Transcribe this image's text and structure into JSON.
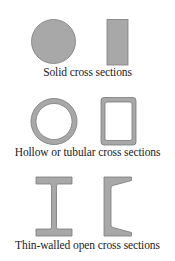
{
  "colors": {
    "fill": "#a8a8a8",
    "stroke": "#7a7a7a",
    "background": "#ffffff",
    "text": "#222222"
  },
  "groups": [
    {
      "caption": "Solid cross sections",
      "shapes": [
        "solid-circle",
        "solid-rectangle"
      ]
    },
    {
      "caption": "Hollow or tubular cross sections",
      "shapes": [
        "hollow-circle",
        "hollow-rectangle"
      ]
    },
    {
      "caption": "Thin-walled open cross sections",
      "shapes": [
        "i-beam",
        "channel-section"
      ]
    }
  ]
}
